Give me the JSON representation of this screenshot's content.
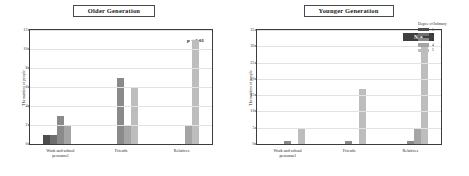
{
  "chart_data": [
    {
      "type": "bar",
      "title": "Older Generation",
      "xlabel": "",
      "ylabel": "The number of people",
      "categories": [
        "Work and school\npersonnel",
        "Friends",
        "Relatives"
      ],
      "yticks": [
        "0",
        "2",
        "4",
        "6",
        "8",
        "10",
        "12"
      ],
      "ylim": [
        0,
        12
      ],
      "grid": true,
      "legend_position": "right-outside",
      "annotation": "p < 0.01",
      "series": [
        {
          "name": "1",
          "values": [
            1,
            0,
            0
          ]
        },
        {
          "name": "2",
          "values": [
            1,
            0,
            0
          ]
        },
        {
          "name": "3",
          "values": [
            3,
            7,
            0
          ]
        },
        {
          "name": "4",
          "values": [
            2,
            2,
            2
          ]
        },
        {
          "name": "5",
          "values": [
            0,
            6,
            11
          ]
        }
      ]
    },
    {
      "type": "bar",
      "title": "Younger Generation",
      "xlabel": "",
      "ylabel": "The number of people",
      "categories": [
        "Work and school\npersonnel",
        "Friends",
        "Relatives"
      ],
      "yticks": [
        "0",
        "5",
        "10",
        "15",
        "20",
        "25",
        "30",
        "35"
      ],
      "ylim": [
        0,
        35
      ],
      "grid": true,
      "legend_position": "right-outside",
      "annotation": "N/A",
      "series": [
        {
          "name": "1",
          "values": [
            0,
            0,
            0
          ]
        },
        {
          "name": "2",
          "values": [
            0,
            0,
            0
          ]
        },
        {
          "name": "3",
          "values": [
            1,
            1,
            1
          ]
        },
        {
          "name": "4",
          "values": [
            0,
            0,
            5
          ]
        },
        {
          "name": "5",
          "values": [
            5,
            17,
            31
          ]
        }
      ]
    }
  ],
  "legend": {
    "title": "Degree of Intimacy",
    "items": [
      {
        "label": "1",
        "color": "#4d4d4d"
      },
      {
        "label": "2",
        "color": "#6e6e6e"
      },
      {
        "label": "3",
        "color": "#8a8a8a"
      },
      {
        "label": "4",
        "color": "#a5a5a5"
      },
      {
        "label": "5",
        "color": "#bdbdbd"
      }
    ]
  },
  "left": {
    "title": "Older Generation",
    "ylabel": "The number of people",
    "annotation": "p < 0.01",
    "yticks": [
      "12",
      "10",
      "8",
      "6",
      "4",
      "2",
      "0"
    ],
    "xlabels": [
      "Work and school\npersonnel",
      "Friends",
      "Relatives"
    ]
  },
  "right": {
    "title": "Younger Generation",
    "ylabel": "The number of people",
    "annotation": "N/A",
    "yticks": [
      "35",
      "30",
      "25",
      "20",
      "15",
      "10",
      "5",
      "0"
    ],
    "xlabels": [
      "Work and school\npersonnel",
      "Friends",
      "Relatives"
    ]
  }
}
